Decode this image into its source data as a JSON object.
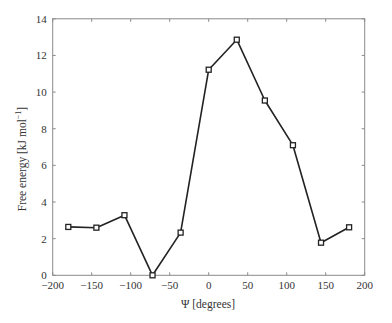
{
  "chart_data": {
    "type": "line",
    "title": "",
    "xlabel": "Ψ [degrees]",
    "ylabel": "Free energy [kJ mol⁻¹]",
    "ylabel_main": "Free energy [kJ mol",
    "ylabel_sup": "−1",
    "ylabel_close": "]",
    "xlim": [
      -200,
      200
    ],
    "ylim": [
      0,
      14
    ],
    "xticks": [
      -200,
      -150,
      -100,
      -50,
      0,
      50,
      100,
      150,
      200
    ],
    "xtick_labels": [
      "−200",
      "−150",
      "−100",
      "−50",
      "0",
      "50",
      "100",
      "150",
      "200"
    ],
    "yticks": [
      0,
      2,
      4,
      6,
      8,
      10,
      12,
      14
    ],
    "ytick_labels": [
      "0",
      "2",
      "4",
      "6",
      "8",
      "10",
      "12",
      "14"
    ],
    "grid": false,
    "legend": null,
    "marker": "square",
    "series": [
      {
        "name": "Free energy",
        "x": [
          -180,
          -144,
          -108,
          -72,
          -36,
          0,
          36,
          72,
          108,
          144,
          180
        ],
        "values": [
          2.64,
          2.6,
          3.28,
          0.0,
          2.33,
          11.22,
          12.86,
          9.54,
          7.1,
          1.78,
          2.62
        ]
      }
    ]
  },
  "colors": {
    "axes": "#8a8a8a",
    "line": "#222222",
    "text": "#333333"
  }
}
